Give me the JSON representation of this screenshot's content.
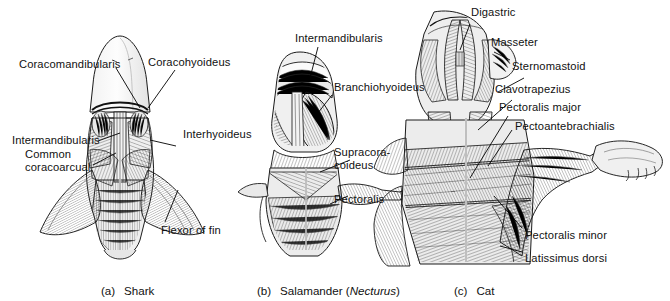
{
  "figure": {
    "background_color": "#ffffff",
    "line_color": "#000000",
    "panels": [
      {
        "id": "a",
        "index_label": "(a)",
        "caption": "Shark",
        "caption_italic": "",
        "labels": [
          {
            "name": "coracomandibularis",
            "text": "Coracomandibularis"
          },
          {
            "name": "coracohyoideus",
            "text": "Coracohyoideus"
          },
          {
            "name": "intermandibularis",
            "text": "Intermandibularis"
          },
          {
            "name": "common-coracoarcual-line1",
            "text": "Common"
          },
          {
            "name": "common-coracoarcual-line2",
            "text": "coracoarcual"
          },
          {
            "name": "interhyoideus",
            "text": "Interhyoideus"
          },
          {
            "name": "flexor-of-fin",
            "text": "Flexor of fin"
          }
        ]
      },
      {
        "id": "b",
        "index_label": "(b)",
        "caption": "Salamander (",
        "caption_italic": "Necturus",
        "caption_tail": ")",
        "labels": [
          {
            "name": "intermandibularis",
            "text": "Intermandibularis"
          },
          {
            "name": "branchiohyoideus",
            "text": "Branchiohyoideus"
          },
          {
            "name": "supracoracoideus-line1",
            "text": "Supracora-"
          },
          {
            "name": "supracoracoideus-line2",
            "text": "coideus"
          },
          {
            "name": "pectoralis",
            "text": "Pectoralis"
          }
        ]
      },
      {
        "id": "c",
        "index_label": "(c)",
        "caption": "Cat",
        "caption_italic": "",
        "labels": [
          {
            "name": "digastric",
            "text": "Digastric"
          },
          {
            "name": "masseter",
            "text": "Masseter"
          },
          {
            "name": "sternomastoid",
            "text": "Sternomastoid"
          },
          {
            "name": "clavotrapezius",
            "text": "Clavotrapezius"
          },
          {
            "name": "pectoralis-major",
            "text": "Pectoralis major"
          },
          {
            "name": "pectoantebrachialis",
            "text": "Pectoantebrachialis"
          },
          {
            "name": "pectoralis-minor",
            "text": "Pectoralis minor"
          },
          {
            "name": "latissimus-dorsi",
            "text": "Latissimus dorsi"
          }
        ]
      }
    ]
  }
}
